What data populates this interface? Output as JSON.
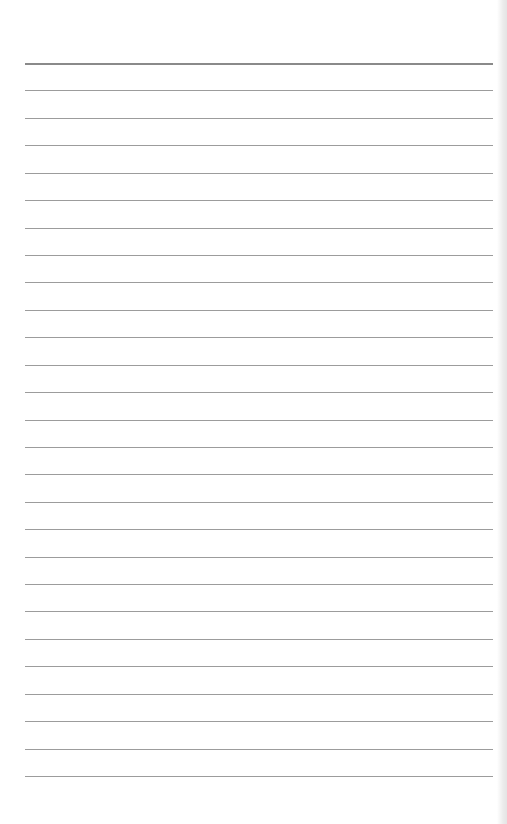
{
  "page": {
    "type": "lined-paper",
    "rule_count": 27,
    "colors": {
      "paper": "#ffffff",
      "rule": "#9c9c9c",
      "top_rule": "#8a8a8a"
    }
  }
}
